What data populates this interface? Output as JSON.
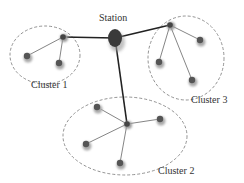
{
  "diagram": {
    "station_label": "Station",
    "clusters": [
      {
        "label": "Cluster 1"
      },
      {
        "label": "Cluster 2"
      },
      {
        "label": "Cluster 3"
      }
    ]
  }
}
